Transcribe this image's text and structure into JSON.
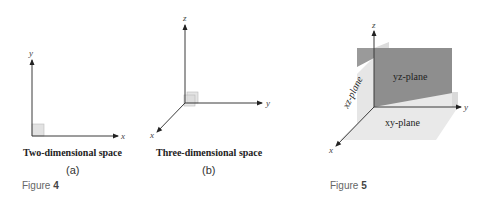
{
  "figure4": {
    "label": "Figure",
    "number": "4",
    "panel_a": {
      "caption": "Two-dimensional space",
      "sublabel": "(a)",
      "axes": {
        "x": "x",
        "y": "y"
      }
    },
    "panel_b": {
      "caption": "Three-dimensional space",
      "sublabel": "(b)",
      "axes": {
        "x": "x",
        "y": "y",
        "z": "z"
      }
    }
  },
  "figure5": {
    "label": "Figure",
    "number": "5",
    "axes": {
      "x": "x",
      "y": "y",
      "z": "z"
    },
    "planes": {
      "yz": "yz-plane",
      "xz": "xz-plane",
      "xy": "xy-plane"
    },
    "colors": {
      "yz_plane": "#8e8e8e",
      "xz_plane": "#e6e6e6",
      "xy_plane": "#e9e9e9",
      "unit_square": "#e2e2e2"
    }
  }
}
